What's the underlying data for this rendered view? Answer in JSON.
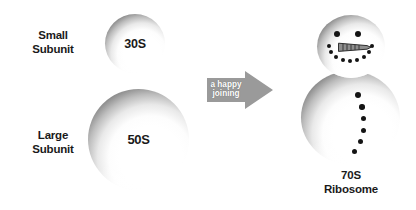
{
  "diagram": {
    "title_text": "Ribosome subunit assembly",
    "background_color": "#ffffff",
    "ink_color": "#1a1a1a"
  },
  "left_column": {
    "small": {
      "label": "Small\nSubunit",
      "sphere_value": "30S"
    },
    "large": {
      "label": "Large\nSubunit",
      "sphere_value": "50S"
    }
  },
  "arrow": {
    "text": "a happy\njoining",
    "fill_color": "#9a9a9a",
    "text_color": "#ffffff",
    "direction": "right"
  },
  "result": {
    "label": "70S\nRibosome",
    "head": {
      "eye_count": 2,
      "nose_name": "carrot-nose",
      "smile_dot_count": 9
    },
    "body": {
      "button_count": 6
    }
  }
}
